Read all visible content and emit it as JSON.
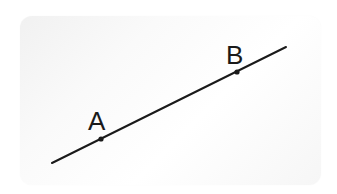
{
  "diagram": {
    "type": "line-through-two-points",
    "line": {
      "x1": 52,
      "y1": 163,
      "x2": 286,
      "y2": 47,
      "color": "#1a1a1a"
    },
    "points": [
      {
        "label": "A",
        "x": 101,
        "y": 139,
        "label_x": 88,
        "label_y": 130
      },
      {
        "label": "B",
        "x": 237,
        "y": 72,
        "label_x": 226,
        "label_y": 64
      }
    ]
  }
}
